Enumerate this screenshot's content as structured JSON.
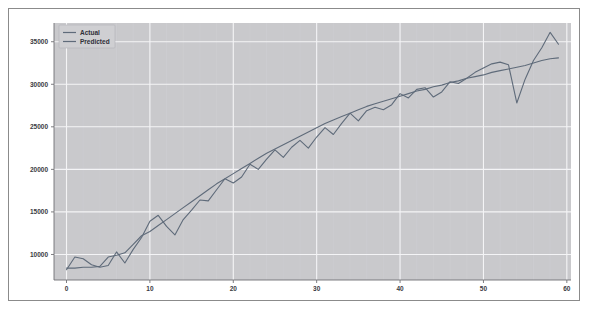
{
  "figure": {
    "background_color": "#ffffff",
    "border_color": "#8b8b8b",
    "plot_background_color": "#c9c9cc",
    "grid_color": "#f4f4f6"
  },
  "legend": {
    "position": "upper-left",
    "entries": [
      {
        "label": "Actual",
        "color": "#5f6b7a"
      },
      {
        "label": "Predicted",
        "color": "#5f6b7a"
      }
    ]
  },
  "axes": {
    "x_ticks": [
      "0",
      "10",
      "20",
      "30",
      "40",
      "50",
      "60"
    ],
    "y_ticks": [
      "10000",
      "15000",
      "20000",
      "25000",
      "30000",
      "35000"
    ]
  },
  "chart_data": {
    "type": "line",
    "title": "",
    "xlabel": "",
    "ylabel": "",
    "xlim": [
      -1.5,
      60.5
    ],
    "ylim": [
      7000,
      37200
    ],
    "grid": true,
    "legend_position": "upper-left",
    "x": [
      0,
      1,
      2,
      3,
      4,
      5,
      6,
      7,
      8,
      9,
      10,
      11,
      12,
      13,
      14,
      15,
      16,
      17,
      18,
      19,
      20,
      21,
      22,
      23,
      24,
      25,
      26,
      27,
      28,
      29,
      30,
      31,
      32,
      33,
      34,
      35,
      36,
      37,
      38,
      39,
      40,
      41,
      42,
      43,
      44,
      45,
      46,
      47,
      48,
      49,
      50,
      51,
      52,
      53,
      54,
      55,
      56,
      57,
      58,
      59
    ],
    "series": [
      {
        "name": "Actual",
        "color": "#5f6b7a",
        "linewidth": 1.1,
        "values": [
          8200,
          9700,
          9500,
          8800,
          8500,
          8700,
          10300,
          9000,
          10600,
          12000,
          13900,
          14600,
          13300,
          12300,
          14100,
          15200,
          16400,
          16300,
          17600,
          18900,
          18400,
          19100,
          20600,
          20000,
          21200,
          22300,
          21400,
          22600,
          23400,
          22500,
          23800,
          24900,
          24100,
          25400,
          26600,
          25700,
          26900,
          27300,
          27000,
          27600,
          28900,
          28400,
          29400,
          29600,
          28500,
          29100,
          30300,
          30100,
          30700,
          31400,
          31900,
          32400,
          32600,
          32300,
          27800,
          30600,
          32800,
          34300,
          36100,
          34700
        ]
      },
      {
        "name": "Predicted",
        "color": "#5f6b7a",
        "linewidth": 1.1,
        "values": [
          8400,
          8400,
          8500,
          8500,
          8600,
          9700,
          9900,
          10200,
          11200,
          12200,
          12700,
          13400,
          14100,
          14800,
          15500,
          16200,
          16900,
          17600,
          18300,
          18900,
          19500,
          20100,
          20700,
          21300,
          21900,
          22400,
          22900,
          23400,
          23900,
          24400,
          24900,
          25400,
          25800,
          26200,
          26600,
          27000,
          27400,
          27700,
          28000,
          28300,
          28600,
          28900,
          29200,
          29400,
          29700,
          29900,
          30200,
          30400,
          30700,
          30900,
          31100,
          31400,
          31600,
          31800,
          32000,
          32200,
          32500,
          32800,
          33000,
          33100
        ]
      }
    ]
  }
}
